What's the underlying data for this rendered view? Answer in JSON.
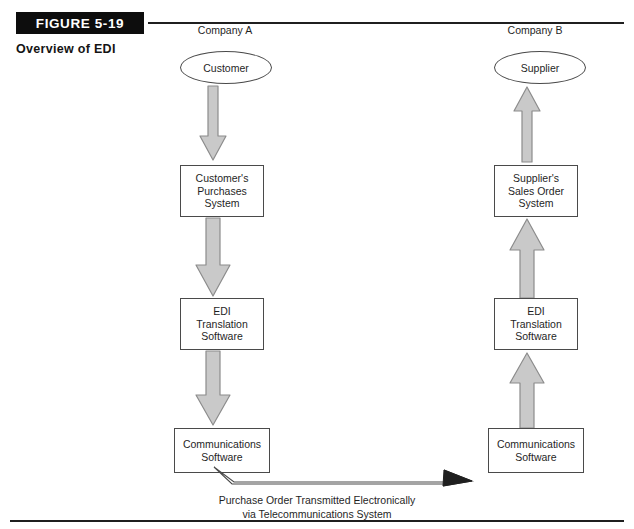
{
  "figure": {
    "banner_label": "FIGURE 5-19",
    "subtitle": "Overview of EDI"
  },
  "colors": {
    "banner_bg": "#0d0d0d",
    "banner_text": "#ffffff",
    "rule": "#1f1f1f",
    "node_border": "#4a4a4a",
    "node_fill": "#ffffff",
    "arrow_fill": "#c9c9c9",
    "arrow_stroke": "#8c8c8c",
    "text": "#1f1f1f"
  },
  "columns": [
    {
      "id": "company-a",
      "heading": "Company A"
    },
    {
      "id": "company-b",
      "heading": "Company B"
    }
  ],
  "nodes": {
    "customer": {
      "label": "Customer",
      "shape": "ellipse"
    },
    "customers_purchases_system": {
      "shape": "box",
      "lines": [
        "Customer's",
        "Purchases",
        "System"
      ]
    },
    "edi_translation_software_left": {
      "shape": "box",
      "lines": [
        "EDI",
        "Translation",
        "Software"
      ]
    },
    "communications_software_left": {
      "shape": "box",
      "lines": [
        "Communications",
        "Software"
      ]
    },
    "supplier": {
      "label": "Supplier",
      "shape": "ellipse"
    },
    "suppliers_sales_order_system": {
      "shape": "box",
      "lines": [
        "Supplier's",
        "Sales Order",
        "System"
      ]
    },
    "edi_translation_software_right": {
      "shape": "box",
      "lines": [
        "EDI",
        "Translation",
        "Software"
      ]
    },
    "communications_software_right": {
      "shape": "box",
      "lines": [
        "Communications",
        "Software"
      ]
    }
  },
  "transmission_link": {
    "caption_line1": "Purchase Order Transmitted Electronically",
    "caption_line2": "via Telecommunications System",
    "direction": "left-to-right"
  },
  "flow": {
    "left_direction": "down",
    "right_direction": "up"
  }
}
